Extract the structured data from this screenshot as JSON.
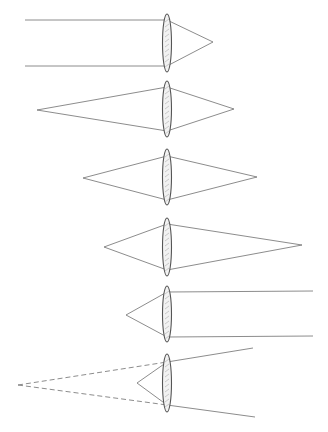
{
  "figure": {
    "title": "",
    "line_color": "#6f6f6f",
    "lens_outline_color": "#555555",
    "lens_fill_color": "#f2f2f2",
    "hatch_color": "#b5b5b5",
    "lens_center_x": 167,
    "lens_half_width": 4.5,
    "diagrams": [
      {
        "id": "parallel-in-focus-out",
        "lens": {
          "cy": 43,
          "ry": 29
        },
        "rays": [
          {
            "points": [
              [
                25,
                20
              ],
              [
                167,
                20
              ],
              [
                213,
                42
              ]
            ],
            "dashed": false
          },
          {
            "points": [
              [
                25,
                66
              ],
              [
                167,
                66
              ],
              [
                213,
                42
              ]
            ],
            "dashed": false
          }
        ]
      },
      {
        "id": "far-object-real-image",
        "lens": {
          "cy": 109,
          "ry": 28
        },
        "rays": [
          {
            "points": [
              [
                37,
                110
              ],
              [
                167,
                87
              ],
              [
                234,
                109
              ]
            ],
            "dashed": false
          },
          {
            "points": [
              [
                37,
                110
              ],
              [
                167,
                131
              ],
              [
                234,
                109
              ]
            ],
            "dashed": false
          }
        ]
      },
      {
        "id": "object-at-2f-image-at-2f",
        "lens": {
          "cy": 177,
          "ry": 28
        },
        "rays": [
          {
            "points": [
              [
                83,
                178
              ],
              [
                167,
                156
              ],
              [
                257,
                177
              ]
            ],
            "dashed": false
          },
          {
            "points": [
              [
                83,
                178
              ],
              [
                167,
                200
              ],
              [
                257,
                177
              ]
            ],
            "dashed": false
          }
        ]
      },
      {
        "id": "near-object-far-image",
        "lens": {
          "cy": 247,
          "ry": 29
        },
        "rays": [
          {
            "points": [
              [
                104,
                247
              ],
              [
                167,
                224
              ],
              [
                302,
                245
              ]
            ],
            "dashed": false
          },
          {
            "points": [
              [
                104,
                247
              ],
              [
                167,
                270
              ],
              [
                302,
                245
              ]
            ],
            "dashed": false
          }
        ]
      },
      {
        "id": "object-at-focus-parallel-out",
        "lens": {
          "cy": 314,
          "ry": 28
        },
        "rays": [
          {
            "points": [
              [
                126,
                315
              ],
              [
                167,
                292
              ],
              [
                313,
                291
              ]
            ],
            "dashed": false
          },
          {
            "points": [
              [
                126,
                315
              ],
              [
                167,
                337
              ],
              [
                313,
                336
              ]
            ],
            "dashed": false
          }
        ]
      },
      {
        "id": "object-inside-focus-virtual-image",
        "lens": {
          "cy": 383,
          "ry": 29
        },
        "rays": [
          {
            "points": [
              [
                137,
                383
              ],
              [
                167,
                362
              ],
              [
                253,
                348
              ]
            ],
            "dashed": false
          },
          {
            "points": [
              [
                137,
                383
              ],
              [
                167,
                405
              ],
              [
                255,
                417
              ]
            ],
            "dashed": false
          },
          {
            "points": [
              [
                18,
                385
              ],
              [
                167,
                362
              ]
            ],
            "dashed": true
          },
          {
            "points": [
              [
                18,
                385
              ],
              [
                167,
                405
              ]
            ],
            "dashed": true
          }
        ]
      }
    ]
  }
}
